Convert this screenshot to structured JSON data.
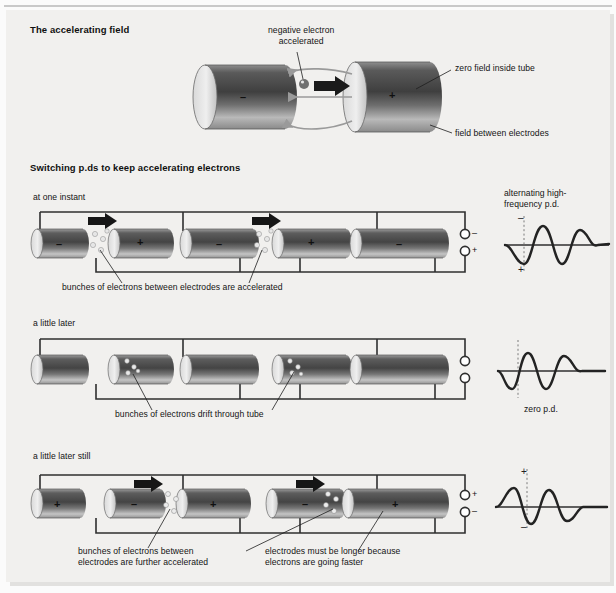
{
  "diagram": {
    "title_section_1": "The accelerating field",
    "title_section_2": "Switching p.ds to keep accelerating electrons"
  },
  "section1": {
    "label_electron": "negative electron\naccelerated",
    "label_zero_field": "zero field inside tube",
    "label_field_between": "field between electrodes",
    "left_electrode_sign": "–",
    "right_electrode_sign": "+"
  },
  "section2": {
    "rows": [
      {
        "caption": "at one instant",
        "bottom_label": "bunches of electrons between electrodes are accelerated",
        "electrode_signs": [
          "–",
          "+",
          "–",
          "+",
          "–"
        ],
        "terminal_top": "–",
        "terminal_bottom": "+",
        "wave_title": "alternating high-\nfrequency p.d.",
        "wave_top_sign": "–",
        "wave_bottom_sign": "+",
        "wave_phase": "negative-at-marker",
        "wave_caption": ""
      },
      {
        "caption": "a little later",
        "bottom_label": "bunches of electrons drift through tube",
        "electrode_signs": [
          "",
          "",
          "",
          "",
          ""
        ],
        "terminal_top": "",
        "terminal_bottom": "",
        "wave_title": "",
        "wave_top_sign": "",
        "wave_bottom_sign": "",
        "wave_phase": "zero-at-marker",
        "wave_caption": "zero p.d."
      },
      {
        "caption": "a little later still",
        "bottom_label": "bunches of electrons between\nelectrodes are further accelerated",
        "bottom_label_2": "electrodes must be longer because\nelectrons are going faster",
        "electrode_signs": [
          "+",
          "–",
          "+",
          "–",
          "+"
        ],
        "terminal_top": "+",
        "terminal_bottom": "–",
        "wave_title": "",
        "wave_top_sign": "+",
        "wave_bottom_sign": "–",
        "wave_phase": "positive-at-marker",
        "wave_caption": ""
      }
    ]
  },
  "colors": {
    "panel_bg": "#f1f0ee",
    "page_bg": "#fbfbfb",
    "electrode_dark": "#4b4b4b",
    "electrode_light": "#d8d8d8",
    "wire": "#2f2f2f",
    "field_line": "#9a9a9a",
    "text": "#141414"
  },
  "icons": {
    "arrow": "acceleration-arrow-icon",
    "electron": "electron-dot-icon",
    "terminal": "terminal-circle-icon"
  }
}
